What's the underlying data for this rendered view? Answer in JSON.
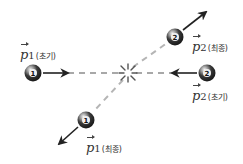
{
  "diagram": {
    "type": "two-ball-collision",
    "colors": {
      "ball_dark": "#2b2b2b",
      "ball_highlight": "#e8e8e8",
      "arrow": "#222222",
      "dashed_path": "#a8a8a8",
      "burst": "#555555",
      "label": "#333333"
    },
    "collision_point": {
      "x": 128,
      "y": 73,
      "icon": "burst-icon"
    },
    "balls": [
      {
        "id": "ball-1-initial",
        "number": "1",
        "x": 33,
        "y": 73
      },
      {
        "id": "ball-2-initial",
        "number": "2",
        "x": 207,
        "y": 73
      },
      {
        "id": "ball-2-final",
        "number": "2",
        "x": 175,
        "y": 37
      },
      {
        "id": "ball-1-final",
        "number": "1",
        "x": 86,
        "y": 120
      }
    ],
    "arrows": [
      {
        "id": "p1-initial-arrow",
        "x1": 43,
        "y1": 73,
        "x2": 68,
        "y2": 73
      },
      {
        "id": "p2-initial-arrow",
        "x1": 197,
        "y1": 73,
        "x2": 172,
        "y2": 73
      },
      {
        "id": "p2-final-arrow",
        "x1": 183,
        "y1": 30,
        "x2": 206,
        "y2": 12
      },
      {
        "id": "p1-final-arrow",
        "x1": 78,
        "y1": 127,
        "x2": 59,
        "y2": 144
      }
    ],
    "labels": {
      "p1_initial": {
        "symbol": "p",
        "subscript": "1",
        "tag": "(초기)"
      },
      "p2_final": {
        "symbol": "p",
        "subscript": "2",
        "tag": "(최종)"
      },
      "p2_initial": {
        "symbol": "p",
        "subscript": "2",
        "tag": "(초기)"
      },
      "p1_final": {
        "symbol": "p",
        "subscript": "1",
        "tag": "(최종)"
      }
    }
  }
}
